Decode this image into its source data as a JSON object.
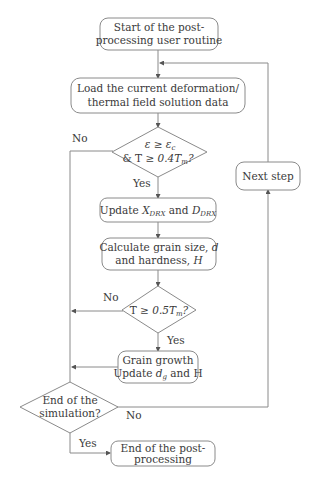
{
  "flowchart": {
    "start": {
      "line1": "Start of the post-",
      "line2": "processing user routine"
    },
    "load": {
      "line1": "Load the current deformation/",
      "line2": "thermal field solution data"
    },
    "decision1": {
      "line1_a": "ε",
      "line1_op": " ≥ ",
      "line1_b": "ε",
      "line1_b_sub": "c",
      "line2_pre": "& T ≥ ",
      "line2_val": "0.4T",
      "line2_sub": "m",
      "line2_post": "?"
    },
    "update": {
      "pre": "Update ",
      "x": "X",
      "x_sub": "DRX",
      "mid": " and ",
      "d": "D",
      "d_sub": "DRX"
    },
    "calc": {
      "line1_pre": "Calculate grain size, ",
      "line1_var": "d",
      "line2_pre": "and hardness, ",
      "line2_var": "H"
    },
    "decision2": {
      "pre": "T ≥ ",
      "val": "0.5T",
      "sub": "m",
      "post": "?"
    },
    "growth": {
      "line1": "Grain growth",
      "line2_pre": "Update ",
      "line2_var": "d",
      "line2_sub": "g",
      "line2_post": " and H"
    },
    "decision3": {
      "line1": "End of the",
      "line2": "simulation?"
    },
    "end": {
      "line1": "End of the post-",
      "line2": "processing"
    },
    "next": {
      "label": "Next step"
    },
    "edges": {
      "yes": "Yes",
      "no": "No"
    }
  },
  "colors": {
    "stroke": "#8a8a8a",
    "text": "#3a3a3a",
    "background": "#ffffff"
  }
}
